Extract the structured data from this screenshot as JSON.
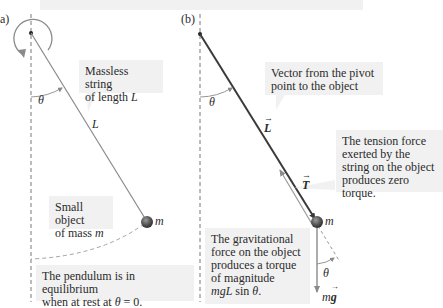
{
  "panel_a": {
    "label": "a)",
    "callout_string": {
      "line1": "Massless string",
      "line2_prefix": "of length ",
      "line2_var": "L"
    },
    "string_label": "L",
    "angle_label": "θ",
    "mass_label": "m",
    "callout_object": {
      "line1": "Small object",
      "line2_prefix": "of mass ",
      "line2_var": "m"
    },
    "callout_equilibrium": {
      "line1": "The pendulum is in equilibrium",
      "line2_prefix": "when at rest at ",
      "line2_var": "θ",
      "line2_suffix": " = 0."
    }
  },
  "panel_b": {
    "label": "(b)",
    "callout_vector": {
      "line1": "Vector from the pivot",
      "line2": "point to the object"
    },
    "vector_L_label": "L",
    "angle_label": "θ",
    "tension_label": "T",
    "mass_label": "m",
    "gravity_label_m": "m",
    "gravity_label_g": "g",
    "lower_angle_label": "θ",
    "callout_tension": {
      "line1": "The tension force",
      "line2": "exerted by the",
      "line3": "string on the object",
      "line4": "produces zero",
      "line5": "torque."
    },
    "callout_gravity": {
      "line1": "The gravitational",
      "line2": "force on the object",
      "line3": "produces a torque",
      "line4": "of magnitude",
      "line5_var": "mgL",
      "line5_mid": " sin ",
      "line5_theta": "θ",
      "line5_end": "."
    }
  },
  "colors": {
    "callout_bg": "#f1f1f1",
    "string_gray": "#8a8a8a",
    "vector_dark": "#3a3a3a",
    "dashed": "#555555",
    "mass_ball": "#5a5a5a"
  }
}
